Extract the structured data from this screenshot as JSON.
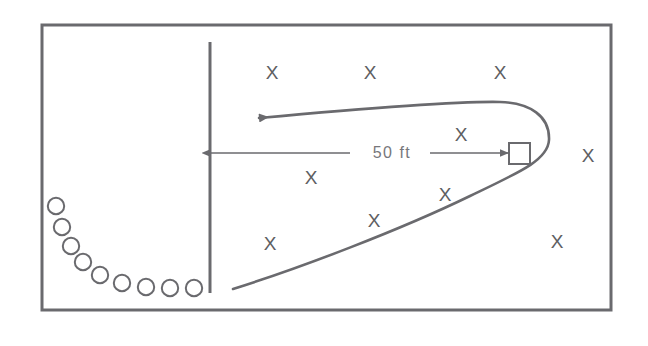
{
  "diagram": {
    "border": {
      "color": "#6a6a6e",
      "x": 42,
      "y": 25,
      "width": 569,
      "height": 285,
      "stroke_width": 3
    },
    "line_of_scrimmage": {
      "label": "line-of-scrimmage",
      "color": "#6a6a6e",
      "x": 210,
      "y1": 42,
      "y2": 293,
      "stroke_width": 3
    },
    "dimension": {
      "label": "50 ft",
      "color": "#77777b",
      "y": 153,
      "x_left": 211,
      "x_right": 509,
      "text_x": 392,
      "text_y": 158,
      "gap_left": 350,
      "gap_right": 430
    },
    "receiver_square": {
      "label": "receiver-marker",
      "color": "#6a6a6e",
      "x": 509,
      "y": 143,
      "size": 21,
      "stroke_width": 2
    },
    "route": {
      "label": "pass-route-path",
      "color": "#6a6a6e",
      "stroke_width": 2.6,
      "path": "M 233 289 C 300 268, 400 230, 470 196 C 520 172, 548 160, 549 140 C 550 116, 530 103, 500 102 C 460 101, 370 108, 259 118",
      "arrow_tip_x": 255,
      "arrow_tip_y": 119
    },
    "defenders": {
      "label": "defender-x-marks",
      "color": "#5e5e62",
      "marks": [
        {
          "id": "x-top-left",
          "x": 272,
          "y": 79
        },
        {
          "id": "x-top-mid",
          "x": 370,
          "y": 79
        },
        {
          "id": "x-top-right",
          "x": 500,
          "y": 79
        },
        {
          "id": "x-mid-near-sq",
          "x": 461,
          "y": 141
        },
        {
          "id": "x-right-outer",
          "x": 588,
          "y": 162
        },
        {
          "id": "x-mid-left",
          "x": 311,
          "y": 184
        },
        {
          "id": "x-mid-right",
          "x": 445,
          "y": 201
        },
        {
          "id": "x-low-mid",
          "x": 374,
          "y": 227
        },
        {
          "id": "x-low-left",
          "x": 270,
          "y": 250
        },
        {
          "id": "x-low-right",
          "x": 557,
          "y": 248
        }
      ]
    },
    "offensive_line": {
      "label": "offensive-line-circles",
      "color": "#6a6a6e",
      "stroke_width": 2,
      "radius": 8.2,
      "circles": [
        {
          "id": "o-1",
          "cx": 56,
          "cy": 206
        },
        {
          "id": "o-2",
          "cx": 62,
          "cy": 227
        },
        {
          "id": "o-3",
          "cx": 71,
          "cy": 246
        },
        {
          "id": "o-4",
          "cx": 83,
          "cy": 262
        },
        {
          "id": "o-5",
          "cx": 100,
          "cy": 275
        },
        {
          "id": "o-6",
          "cx": 122,
          "cy": 283
        },
        {
          "id": "o-7",
          "cx": 146,
          "cy": 287
        },
        {
          "id": "o-8",
          "cx": 170,
          "cy": 288
        },
        {
          "id": "o-9",
          "cx": 194,
          "cy": 288
        }
      ]
    }
  }
}
